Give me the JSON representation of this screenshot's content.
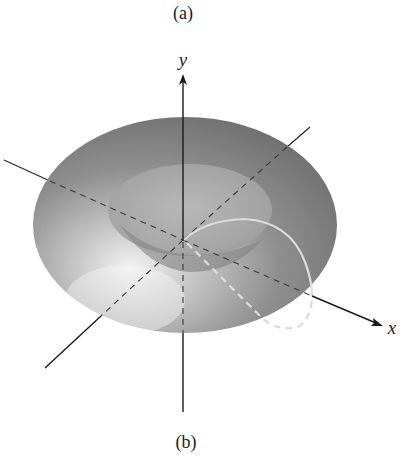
{
  "figure": {
    "caption_top": "(a)",
    "caption_bottom": "(b)",
    "axes": {
      "y_label": "y",
      "x_label": "x"
    },
    "colors": {
      "torus_outer": "#7a7a7a",
      "torus_highlight": "#e6e6e6",
      "hole_band": "#a8a8a8",
      "axis": "#1a1a1a",
      "curve": "#d9d9d9"
    }
  }
}
